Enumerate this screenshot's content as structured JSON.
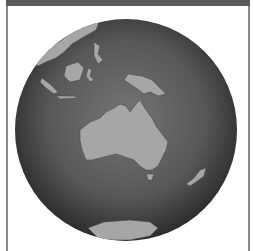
{
  "image": {
    "description": "Greyscale globe centered on Australia and the western Pacific",
    "subject": "globe",
    "regions_visible": [
      "Australia",
      "New Guinea",
      "Indonesia",
      "Philippines",
      "New Zealand",
      "Antarctica"
    ]
  },
  "colors": {
    "frame_bar": "#5a5a5a",
    "frame_border": "#8a8a8a",
    "ocean_center": "#6e6e6e",
    "ocean_edge": "#2e2e2e",
    "land": "#a8a8a8"
  }
}
